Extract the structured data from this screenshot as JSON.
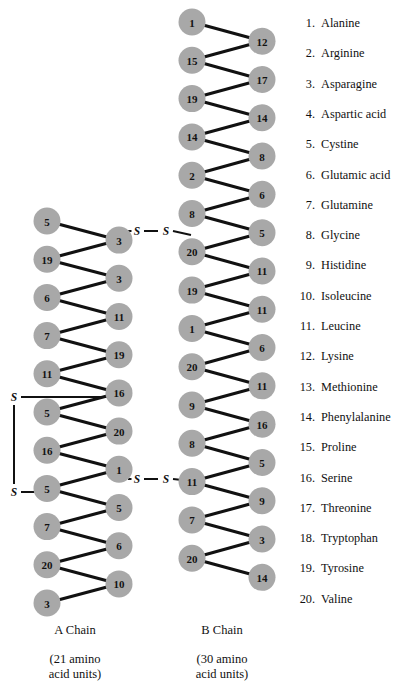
{
  "figure": {
    "node_fill": "#a8a8a8",
    "bond_color": "#111111",
    "background": "#ffffff"
  },
  "legend": {
    "items": [
      {
        "num": "1.",
        "name": "Alanine"
      },
      {
        "num": "2.",
        "name": "Arginine"
      },
      {
        "num": "3.",
        "name": "Asparagine"
      },
      {
        "num": "4.",
        "name": "Aspartic acid"
      },
      {
        "num": "5.",
        "name": "Cystine"
      },
      {
        "num": "6.",
        "name": "Glutamic acid"
      },
      {
        "num": "7.",
        "name": "Glutamine"
      },
      {
        "num": "8.",
        "name": "Glycine"
      },
      {
        "num": "9.",
        "name": "Histidine"
      },
      {
        "num": "10.",
        "name": "Isoleucine"
      },
      {
        "num": "11.",
        "name": "Leucine"
      },
      {
        "num": "12.",
        "name": "Lysine"
      },
      {
        "num": "13.",
        "name": "Methionine"
      },
      {
        "num": "14.",
        "name": "Phenylalanine"
      },
      {
        "num": "15.",
        "name": "Proline"
      },
      {
        "num": "16.",
        "name": "Serine"
      },
      {
        "num": "17.",
        "name": "Threonine"
      },
      {
        "num": "18.",
        "name": "Tryptophan"
      },
      {
        "num": "19.",
        "name": "Tyrosine"
      },
      {
        "num": "20.",
        "name": "Valine"
      }
    ]
  },
  "chains": {
    "a": {
      "caption": "A Chain",
      "sub_line1": "(21 amino",
      "sub_line2": "acid units)",
      "count_text": "21 amino acid units",
      "sequence": [
        5,
        3,
        19,
        3,
        6,
        11,
        7,
        19,
        11,
        16,
        5,
        20,
        16,
        1,
        5,
        5,
        7,
        6,
        20,
        10,
        3
      ],
      "left_column": [
        5,
        3,
        11,
        19,
        16,
        20,
        1,
        5,
        6,
        10
      ],
      "right_column": [
        3,
        19,
        6,
        7,
        11,
        5,
        16,
        5,
        7,
        20,
        3
      ]
    },
    "b": {
      "caption": "B Chain",
      "sub_line1": "(30 amino",
      "sub_line2": "acid units)",
      "count_text": "30 amino acid units",
      "sequence": [
        1,
        12,
        15,
        17,
        19,
        14,
        14,
        8,
        2,
        6,
        8,
        5,
        20,
        11,
        19,
        11,
        1,
        6,
        20,
        11,
        9,
        16,
        8,
        5,
        11,
        9,
        7,
        3,
        20,
        14
      ],
      "left_column": [
        1,
        15,
        19,
        14,
        2,
        8,
        20,
        19,
        1,
        20,
        9,
        8,
        11,
        7,
        20
      ],
      "right_column": [
        12,
        17,
        14,
        8,
        6,
        5,
        11,
        11,
        6,
        11,
        16,
        5,
        9,
        3,
        14
      ]
    }
  },
  "bridges": {
    "sulfur_symbol": "S",
    "interchain_upper_label": "S—S",
    "interchain_lower_label": "S—S",
    "intrachain_label": "S—S"
  },
  "chart_data": {
    "type": "diagram",
    "a_chain_sequence": [
      5,
      3,
      19,
      3,
      6,
      11,
      7,
      19,
      11,
      16,
      5,
      20,
      16,
      1,
      5,
      5,
      7,
      6,
      20,
      10,
      3
    ],
    "b_chain_sequence": [
      1,
      12,
      15,
      17,
      19,
      14,
      14,
      8,
      2,
      6,
      8,
      5,
      20,
      11,
      19,
      11,
      1,
      6,
      20,
      11,
      9,
      16,
      8,
      5,
      11,
      9,
      7,
      3,
      20,
      14
    ],
    "disulfide_bridges": 3,
    "legend_codes": {
      "1": "Alanine",
      "2": "Arginine",
      "3": "Asparagine",
      "4": "Aspartic acid",
      "5": "Cystine",
      "6": "Glutamic acid",
      "7": "Glutamine",
      "8": "Glycine",
      "9": "Histidine",
      "10": "Isoleucine",
      "11": "Leucine",
      "12": "Lysine",
      "13": "Methionine",
      "14": "Phenylalanine",
      "15": "Proline",
      "16": "Serine",
      "17": "Threonine",
      "18": "Tryptophan",
      "19": "Tyrosine",
      "20": "Valine"
    }
  }
}
